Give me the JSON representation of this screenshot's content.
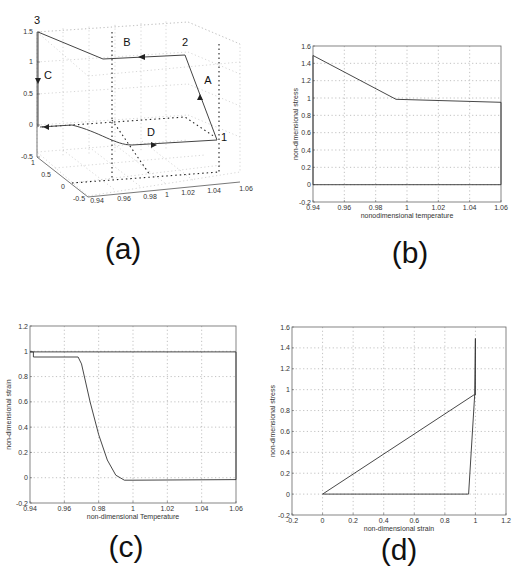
{
  "captions": {
    "a": "(a)",
    "b": "(b)",
    "c": "(c)",
    "d": "(d)"
  },
  "chart_data": [
    {
      "id": "a",
      "type": "line",
      "subtype": "3d-line",
      "title": "",
      "xlabel": "",
      "ylabel": "",
      "zlabel": "",
      "x_ticks": [
        "0.94",
        "0.96",
        "0.98",
        "1",
        "1.02",
        "1.04",
        "1.06"
      ],
      "y_ticks": [
        "-0.5",
        "0",
        "0.5",
        "1"
      ],
      "z_ticks": [
        "-0.5",
        "0",
        "0.5",
        "1",
        "1.5"
      ],
      "point_labels": [
        "1",
        "2",
        "3"
      ],
      "segment_labels": [
        "A",
        "B",
        "C",
        "D"
      ],
      "grid": true,
      "note": "3D cycle: temperature (x) vs strain (y) vs stress (z); dotted lines are projections"
    },
    {
      "id": "b",
      "type": "line",
      "title": "",
      "xlabel": "nonodimensional temperature",
      "ylabel": "non-dimensional stress",
      "xlim": [
        0.94,
        1.06
      ],
      "ylim": [
        -0.2,
        1.6
      ],
      "x_ticks": [
        "0.94",
        "0.96",
        "0.98",
        "1",
        "1.02",
        "1.04",
        "1.06"
      ],
      "y_ticks": [
        "-0.2",
        "0",
        "0.2",
        "0.4",
        "0.6",
        "0.8",
        "1",
        "1.2",
        "1.4",
        "1.6"
      ],
      "grid": true,
      "series": [
        {
          "name": "cycle",
          "x": [
            1.06,
            1.06,
            0.993,
            0.94,
            0.94,
            1.06
          ],
          "y": [
            0,
            0.95,
            0.985,
            1.49,
            0,
            0
          ]
        }
      ]
    },
    {
      "id": "c",
      "type": "line",
      "title": "",
      "xlabel": "non-dimensional Temperature",
      "ylabel": "non-dimensional strain",
      "xlim": [
        0.94,
        1.06
      ],
      "ylim": [
        -0.2,
        1.2
      ],
      "x_ticks": [
        "0.94",
        "0.96",
        "0.98",
        "1",
        "1.02",
        "1.04",
        "1.06"
      ],
      "y_ticks": [
        "-0.2",
        "0",
        "0.2",
        "0.4",
        "0.6",
        "0.8",
        "1",
        "1.2"
      ],
      "grid": true,
      "series": [
        {
          "name": "cycle",
          "x": [
            0.94,
            0.942,
            0.942,
            0.968,
            0.97,
            0.975,
            0.98,
            0.985,
            0.99,
            0.995,
            1.0,
            1.06,
            1.06,
            0.94
          ],
          "y": [
            0.995,
            0.995,
            0.955,
            0.955,
            0.9,
            0.6,
            0.34,
            0.14,
            0.02,
            -0.02,
            -0.02,
            -0.015,
            0.995,
            0.995
          ]
        }
      ]
    },
    {
      "id": "d",
      "type": "line",
      "title": "",
      "xlabel": "non-dimensional strain",
      "ylabel": "non-dimensional stress",
      "xlim": [
        -0.2,
        1.2
      ],
      "ylim": [
        -0.2,
        1.6
      ],
      "x_ticks": [
        "-0.2",
        "0",
        "0.2",
        "0.4",
        "0.6",
        "0.8",
        "1",
        "1.2"
      ],
      "y_ticks": [
        "-0.2",
        "0",
        "0.2",
        "0.4",
        "0.6",
        "0.8",
        "1",
        "1.2",
        "1.4",
        "1.6"
      ],
      "grid": true,
      "series": [
        {
          "name": "cycle",
          "x": [
            0,
            0.955,
            0.995,
            1.0,
            1.0,
            0.99,
            0.0
          ],
          "y": [
            0,
            0,
            0.95,
            1.49,
            0.95,
            0.95,
            0
          ]
        }
      ]
    }
  ]
}
